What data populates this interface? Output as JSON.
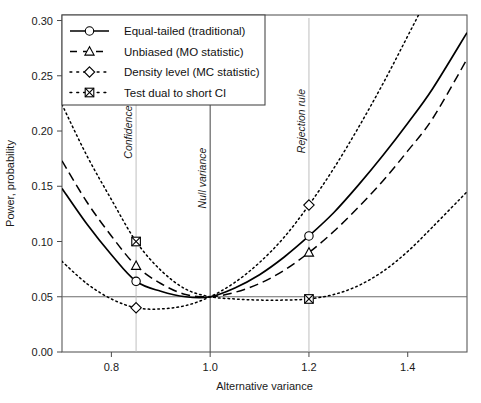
{
  "chart_data": {
    "type": "line",
    "title": "",
    "xlabel": "Alternative variance",
    "ylabel": "Power, probability",
    "xlim": [
      0.7,
      1.52
    ],
    "ylim": [
      0.0,
      0.305
    ],
    "xticks": [
      0.8,
      1.0,
      1.2,
      1.4
    ],
    "xticklabels": [
      "0.8",
      "1.0",
      "1.2",
      "1.4"
    ],
    "yticks": [
      0.0,
      0.05,
      0.1,
      0.15,
      0.2,
      0.25,
      0.3
    ],
    "yticklabels": [
      "0.00",
      "0.05",
      "0.10",
      "0.15",
      "0.20",
      "0.25",
      "0.30"
    ],
    "grid": false,
    "legend_position": "top-left",
    "reference_lines": [
      {
        "name": "significance-level",
        "orientation": "horizontal",
        "value": 0.05
      },
      {
        "name": "null-variance",
        "orientation": "vertical",
        "value": 1.0
      },
      {
        "name": "confidence-interval-marker",
        "orientation": "vertical",
        "value": 0.85
      },
      {
        "name": "rejection-rule-marker",
        "orientation": "vertical",
        "value": 1.2
      }
    ],
    "annotations": [
      {
        "text": "Confidence interval",
        "x": 0.85,
        "y": 0.175,
        "rotation": -90
      },
      {
        "text": "Null variance",
        "x": 1.0,
        "y": 0.13,
        "rotation": -90
      },
      {
        "text": "Rejection rule",
        "x": 1.2,
        "y": 0.18,
        "rotation": -90
      }
    ],
    "series": [
      {
        "name": "Equal-tailed (traditional)",
        "style": "solid",
        "marker": "circle",
        "color": "#000000",
        "x": [
          0.7,
          0.75,
          0.8,
          0.85,
          0.9,
          0.95,
          1.0,
          1.05,
          1.1,
          1.15,
          1.2,
          1.25,
          1.3,
          1.35,
          1.4,
          1.45,
          1.52
        ],
        "y": [
          0.148,
          0.116,
          0.088,
          0.064,
          0.055,
          0.05,
          0.05,
          0.058,
          0.07,
          0.086,
          0.105,
          0.126,
          0.151,
          0.178,
          0.207,
          0.238,
          0.289
        ],
        "marked_points": [
          {
            "x": 0.85,
            "y": 0.064
          },
          {
            "x": 1.2,
            "y": 0.105
          }
        ]
      },
      {
        "name": "Unbiased (MO statistic)",
        "style": "dashed",
        "marker": "triangle",
        "color": "#000000",
        "x": [
          0.7,
          0.75,
          0.8,
          0.85,
          0.9,
          0.95,
          1.0,
          1.05,
          1.1,
          1.15,
          1.2,
          1.25,
          1.3,
          1.35,
          1.4,
          1.45,
          1.52
        ],
        "y": [
          0.173,
          0.136,
          0.105,
          0.078,
          0.062,
          0.052,
          0.05,
          0.054,
          0.062,
          0.074,
          0.09,
          0.109,
          0.131,
          0.155,
          0.182,
          0.211,
          0.265
        ],
        "marked_points": [
          {
            "x": 0.85,
            "y": 0.078
          },
          {
            "x": 1.2,
            "y": 0.09
          }
        ]
      },
      {
        "name": "Density level (MC statistic)",
        "style": "dotted",
        "marker": "diamond",
        "color": "#000000",
        "x": [
          0.7,
          0.75,
          0.8,
          0.85,
          0.9,
          0.95,
          1.0,
          1.05,
          1.1,
          1.15,
          1.2,
          1.25,
          1.3,
          1.35,
          1.4,
          1.45,
          1.52
        ],
        "y": [
          0.082,
          0.062,
          0.048,
          0.04,
          0.039,
          0.042,
          0.05,
          0.063,
          0.081,
          0.104,
          0.133,
          0.166,
          0.203,
          0.243,
          0.286,
          0.33,
          0.395
        ],
        "marked_points": [
          {
            "x": 0.85,
            "y": 0.04
          },
          {
            "x": 1.2,
            "y": 0.133
          }
        ]
      },
      {
        "name": "Test dual to short CI",
        "style": "dotted",
        "marker": "square-x",
        "color": "#000000",
        "x": [
          0.7,
          0.75,
          0.8,
          0.85,
          0.9,
          0.95,
          1.0,
          1.05,
          1.1,
          1.15,
          1.2,
          1.25,
          1.3,
          1.35,
          1.4,
          1.45,
          1.52
        ],
        "y": [
          0.224,
          0.178,
          0.138,
          0.1,
          0.074,
          0.057,
          0.05,
          0.048,
          0.047,
          0.047,
          0.048,
          0.052,
          0.06,
          0.073,
          0.091,
          0.113,
          0.145
        ],
        "marked_points": [
          {
            "x": 0.85,
            "y": 0.1
          },
          {
            "x": 1.2,
            "y": 0.048
          }
        ]
      }
    ]
  },
  "legend": {
    "items": [
      {
        "label": "Equal-tailed (traditional)",
        "marker": "circle",
        "style": "solid"
      },
      {
        "label": "Unbiased (MO statistic)",
        "marker": "triangle",
        "style": "dashed"
      },
      {
        "label": "Density level (MC statistic)",
        "marker": "diamond",
        "style": "dotted"
      },
      {
        "label": "Test dual to short CI",
        "marker": "square-x",
        "style": "dotted"
      }
    ]
  }
}
